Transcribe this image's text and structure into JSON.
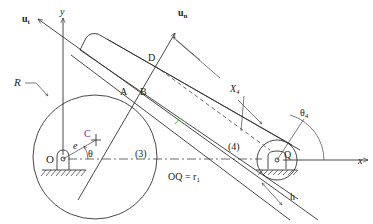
{
  "figure": {
    "type": "cam-follower mechanism diagram",
    "labels": {
      "ut": "u",
      "ut_sub": "t",
      "un": "u",
      "un_sub": "n",
      "y_axis": "y",
      "x_axis": "x",
      "R": "R",
      "A": "A",
      "B": "B",
      "C": "C",
      "D": "D",
      "O": "O",
      "Q": "Q",
      "e": "e",
      "theta": "θ",
      "theta4": "θ",
      "theta4_sub": "4",
      "X4": "X",
      "X4_sub": "4",
      "link3": "(3)",
      "link4": "(4)",
      "OQ_eq": "OQ = r",
      "OQ_sub": "1",
      "h": "h"
    },
    "colors": {
      "line": "#333333",
      "label_C": "#7a2a9a",
      "accent_green": "#3cbf3c",
      "background": "#ffffff"
    }
  }
}
